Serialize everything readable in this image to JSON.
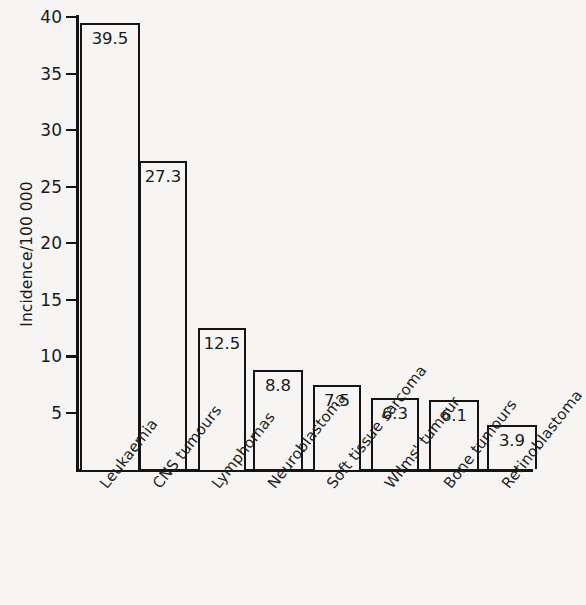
{
  "chart_data": {
    "type": "bar",
    "title": "",
    "subtitle": "",
    "xlabel": "",
    "ylabel": "Incidence/100 000",
    "ylim": [
      0,
      40
    ],
    "ytick_values": [
      40,
      35,
      30,
      25,
      20,
      15,
      10,
      5
    ],
    "ytick_labels": [
      "40",
      "35",
      "30",
      "25",
      "20",
      "15",
      "10",
      "5"
    ],
    "grid": false,
    "legend": null,
    "categories": [
      "Leukaemia",
      "CNS tumours",
      "Lymphomas",
      "Neuroblastoma",
      "Soft tissue sarcoma",
      "Wilms' tumour",
      "Bone tumours",
      "Retinoblastoma"
    ],
    "values": [
      39.5,
      27.3,
      12.5,
      8.8,
      7.5,
      6.3,
      6.1,
      3.9
    ],
    "value_labels": [
      "39.5",
      "27.3",
      "12.5",
      "8.8",
      "7.5",
      "6.3",
      "6.1",
      "3.9"
    ],
    "bar_style": {
      "fill": "#f6f5f3",
      "edge_color": "#141414",
      "edge_width": 2.2
    },
    "axis_color": "#141414",
    "background": "#f6f5f3"
  }
}
